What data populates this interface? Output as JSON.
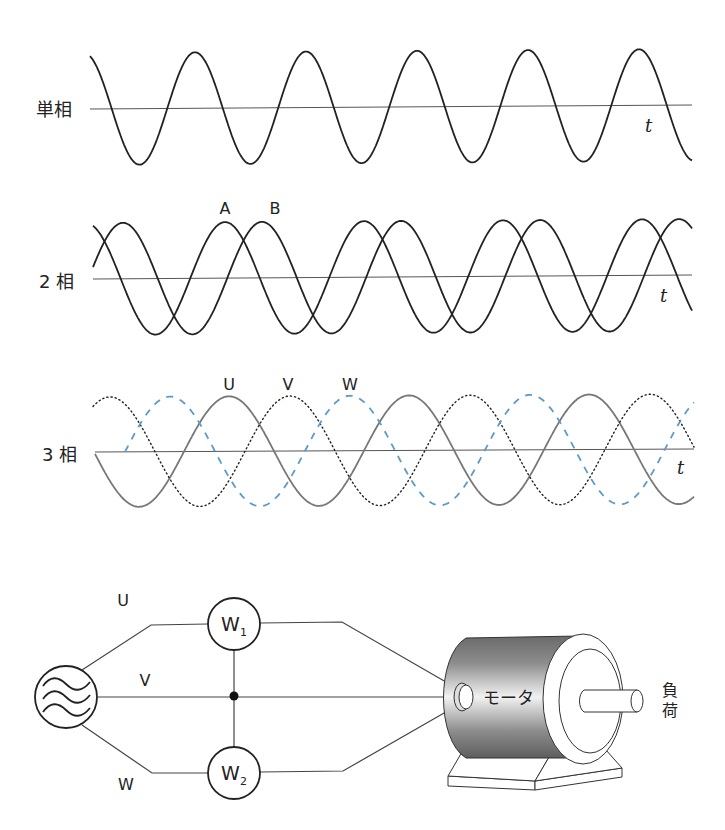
{
  "panels": {
    "single": {
      "label": "単相",
      "t_label": "t",
      "axis": {
        "x1": 90,
        "y1": 109,
        "x2": 692,
        "y2": 105
      },
      "x_start": 90,
      "x_end": 692,
      "amplitude": 56,
      "period": 111,
      "series": [
        {
          "name": "single-phase",
          "peak_x": 195,
          "color": "#222222",
          "style": "solid",
          "width": 1.8
        }
      ]
    },
    "two": {
      "label": "2 相",
      "t_label": "t",
      "axis": {
        "x1": 93,
        "y1": 279,
        "x2": 692,
        "y2": 275
      },
      "x_start": 93,
      "x_end": 692,
      "amplitude": 56,
      "period": 139,
      "series": [
        {
          "name": "A",
          "peak_x": 225,
          "color": "#222222",
          "style": "solid",
          "width": 1.8,
          "label_x": 225,
          "label_y": 214
        },
        {
          "name": "B",
          "peak_x": 262,
          "color": "#222222",
          "style": "solid",
          "width": 1.8,
          "label_x": 275,
          "label_y": 214
        }
      ]
    },
    "three": {
      "label": "3 相",
      "t_label": "t",
      "axis": {
        "x1": 95,
        "y1": 452,
        "x2": 694,
        "y2": 449
      },
      "x_start": 95,
      "x_end": 694,
      "amplitude": 55,
      "period": 180,
      "series": [
        {
          "name": "U",
          "peak_x": 229,
          "color": "#777777",
          "style": "solid",
          "width": 1.8,
          "label_x": 229,
          "label_y": 390
        },
        {
          "name": "V",
          "peak_x": 290,
          "color": "#222222",
          "style": "dotted",
          "width": 1.4,
          "label_x": 288,
          "label_y": 390,
          "x_start": 93
        },
        {
          "name": "W",
          "peak_x": 170,
          "color": "#5b9ac9",
          "style": "dashed",
          "width": 1.8,
          "label_x": 350,
          "label_y": 390,
          "x_start": 125
        }
      ]
    }
  },
  "circuit": {
    "line_labels": {
      "u": "U",
      "v": "V",
      "w": "W"
    },
    "wattmeter1": {
      "letter": "W",
      "sub": "1"
    },
    "wattmeter2": {
      "letter": "W",
      "sub": "2"
    },
    "motor_label": "モータ",
    "load_label_1": "負",
    "load_label_2": "荷"
  },
  "chart_data": {
    "type": "line",
    "title": "",
    "panels": [
      {
        "label": "単相",
        "xlabel": "t",
        "series": [
          {
            "name": "single-phase",
            "phase_deg": 0
          }
        ],
        "cycles_shown": 5.4
      },
      {
        "label": "2 相",
        "xlabel": "t",
        "series": [
          {
            "name": "A",
            "phase_deg": 0
          },
          {
            "name": "B",
            "phase_deg": -90
          }
        ],
        "cycles_shown": 4.3
      },
      {
        "label": "3 相",
        "xlabel": "t",
        "series": [
          {
            "name": "U",
            "phase_deg": 0
          },
          {
            "name": "V",
            "phase_deg": -120
          },
          {
            "name": "W",
            "phase_deg": -240
          }
        ],
        "cycles_shown": 3.3
      }
    ]
  }
}
